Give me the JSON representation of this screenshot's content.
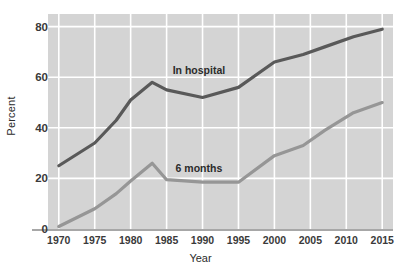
{
  "chart_data": {
    "type": "line",
    "title": "",
    "xlabel": "Year",
    "ylabel": "Percent",
    "xlim": [
      1968.5,
      2016.5
    ],
    "ylim": [
      0,
      85
    ],
    "grid": true,
    "grid_color": "#ffffff",
    "plot_background": "#d4d4d4",
    "page_background": "#ffffff",
    "legend_position": "inline-annotation",
    "x_ticks": [
      1970,
      1975,
      1980,
      1985,
      1990,
      1995,
      2000,
      2005,
      2010,
      2015
    ],
    "y_ticks": [
      0,
      20,
      40,
      60,
      80
    ],
    "x_tick_labels": [
      "1970",
      "1975",
      "1980",
      "1985",
      "1990",
      "1995",
      "2000",
      "2005",
      "2010",
      "2015"
    ],
    "y_tick_labels": [
      "0",
      "20",
      "40",
      "60",
      "80"
    ],
    "series": [
      {
        "name": "In hospital",
        "color": "#595959",
        "label_x": 1989.5,
        "label_y": 63,
        "x": [
          1970,
          1975,
          1978,
          1980,
          1983,
          1985,
          1990,
          1995,
          2000,
          2004,
          2007,
          2011,
          2015
        ],
        "values": [
          25,
          34,
          43,
          51,
          58,
          55,
          52,
          56,
          66,
          69,
          72,
          76,
          79
        ]
      },
      {
        "name": "6 months",
        "color": "#969696",
        "label_x": 1989.5,
        "label_y": 24,
        "x": [
          1970,
          1975,
          1978,
          1980,
          1983,
          1985,
          1990,
          1995,
          2000,
          2004,
          2007,
          2011,
          2015
        ],
        "values": [
          1,
          8,
          14,
          19,
          26,
          19.5,
          18.5,
          18.5,
          29,
          33,
          39,
          46,
          50
        ]
      }
    ],
    "annotations": [
      {
        "text": "In hospital",
        "x": 1989.5,
        "y": 63
      },
      {
        "text": "6 months",
        "x": 1989.5,
        "y": 24
      }
    ]
  },
  "axis": {
    "y_title": "Percent",
    "x_title": "Year"
  }
}
